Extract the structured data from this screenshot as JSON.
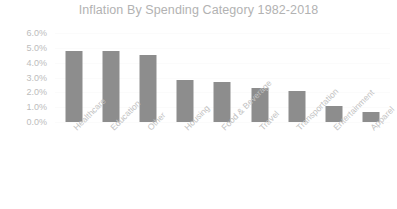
{
  "chart_data": {
    "type": "bar",
    "title": "Inflation By Spending Category 1982-2018",
    "xlabel": "",
    "ylabel": "",
    "categories": [
      "Healthcare",
      "Education",
      "Other",
      "Housing",
      "Food & Beverage",
      "Travel",
      "Transportation",
      "Entertainment",
      "Apparel"
    ],
    "values": [
      4.8,
      4.8,
      4.5,
      2.8,
      2.7,
      2.3,
      2.1,
      1.1,
      0.7
    ],
    "value_unit": "%",
    "ylim": [
      0.0,
      6.0
    ],
    "ytick_labels": [
      "6.0%",
      "5.0%",
      "4.0%",
      "3.0%",
      "2.0%",
      "1.0%",
      "0.0%"
    ],
    "ytick_values": [
      6.0,
      5.0,
      4.0,
      3.0,
      2.0,
      1.0,
      0.0
    ],
    "grid": false,
    "legend": false,
    "legend_position": "none",
    "bar_color": "#8d8d8d",
    "title_color": "#b2b2b2",
    "tick_label_color": "#bcbcbc",
    "category_label_color": "#c2c2c2",
    "category_label_rotation": -45,
    "background_color": "#ffffff"
  }
}
